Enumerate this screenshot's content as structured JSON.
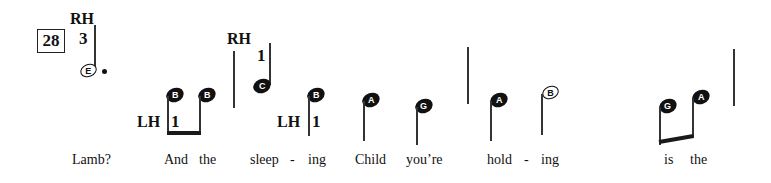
{
  "measure_number": "28",
  "hand_labels": {
    "rh_1": "RH",
    "rh_2": "RH",
    "lh_1": "LH",
    "lh_2": "LH"
  },
  "fingerings": {
    "rh_1": "3",
    "rh_2": "1",
    "lh_1": "1",
    "lh_2": "1"
  },
  "notes": [
    {
      "name": "E",
      "type": "dotted-half",
      "hand": "RH"
    },
    {
      "name": "B",
      "type": "eighth",
      "hand": "LH"
    },
    {
      "name": "B",
      "type": "eighth",
      "hand": "LH"
    },
    {
      "name": "C",
      "type": "quarter",
      "hand": "RH"
    },
    {
      "name": "B",
      "type": "quarter",
      "hand": "LH"
    },
    {
      "name": "A",
      "type": "quarter",
      "hand": "LH"
    },
    {
      "name": "G",
      "type": "quarter",
      "hand": "LH"
    },
    {
      "name": "A",
      "type": "quarter",
      "hand": "LH"
    },
    {
      "name": "B",
      "type": "half",
      "hand": "LH"
    },
    {
      "name": "G",
      "type": "eighth",
      "hand": "LH"
    },
    {
      "name": "A",
      "type": "eighth",
      "hand": "LH"
    }
  ],
  "lyrics": [
    "Lamb?",
    "And",
    "the",
    "sleep",
    "-",
    "ing",
    "Child",
    "you’re",
    "hold",
    "-",
    "ing",
    "is",
    "the"
  ]
}
